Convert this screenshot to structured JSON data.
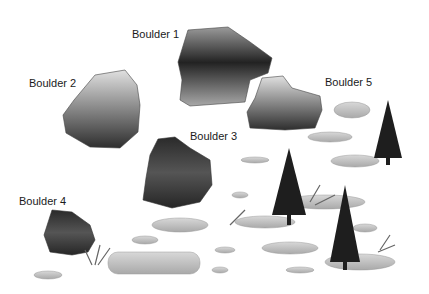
{
  "labels": {
    "boulder1": "Boulder 1",
    "boulder2": "Boulder 2",
    "boulder3": "Boulder 3",
    "boulder4": "Boulder 4",
    "boulder5": "Boulder 5"
  },
  "colors": {
    "boulder_light": "#c8c8c8",
    "boulder_dark": "#2a2a2a",
    "ice_patch": "#bdbdbd",
    "tree": "#1e1e1e",
    "background": "#ffffff"
  }
}
